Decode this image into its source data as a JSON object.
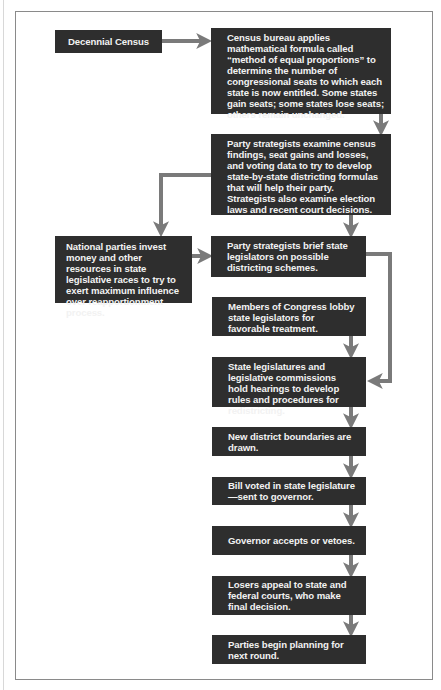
{
  "diagram": {
    "type": "flowchart",
    "colors": {
      "box_fill": "#2e2e2e",
      "box_text": "#f2f2f2",
      "arrow": "#7a7a7a",
      "frame": "#8a8a8a"
    },
    "nodes": {
      "census": "Decennial Census",
      "bureau": "Census bureau applies mathematical formula called “method of equal proportions” to determine the number of congressional seats to which each state is now entitled. Some states gain seats; some states lose seats; others remain unchanged.",
      "strategists_examine": "Party strategists examine census findings, seat gains and losses, and voting data to try to develop state-by-state districting formulas that will help their party. Strategists also examine election laws and recent court decisions.",
      "national_parties": "National parties invest money and other resources in state legislative races to try to exert maximum influence over reapportionment process.",
      "strategists_brief": "Party strategists brief state legislators on possible districting schemes.",
      "congress_lobby": "Members of Congress lobby state legislators for favorable treatment.",
      "hearings": "State legislatures and legislative commissions hold hearings to develop rules and procedures for redistricting.",
      "boundaries": "New district boundaries are drawn.",
      "bill": "Bill voted in state legislature—sent to governor.",
      "governor": "Governor accepts or vetoes.",
      "appeal": "Losers appeal to state and federal courts, who make final decision.",
      "next_round": "Parties begin planning for next round."
    },
    "edges": [
      [
        "census",
        "bureau"
      ],
      [
        "bureau",
        "strategists_examine"
      ],
      [
        "strategists_examine",
        "national_parties"
      ],
      [
        "strategists_examine",
        "strategists_brief"
      ],
      [
        "national_parties",
        "strategists_brief"
      ],
      [
        "strategists_brief",
        "hearings"
      ],
      [
        "congress_lobby",
        "hearings"
      ],
      [
        "hearings",
        "boundaries"
      ],
      [
        "boundaries",
        "bill"
      ],
      [
        "bill",
        "governor"
      ],
      [
        "governor",
        "appeal"
      ],
      [
        "appeal",
        "next_round"
      ]
    ]
  }
}
